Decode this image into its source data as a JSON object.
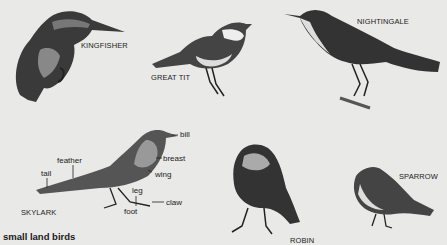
{
  "caption": "small land birds",
  "birds": [
    {
      "name": "KINGFISHER"
    },
    {
      "name": "GREAT TIT"
    },
    {
      "name": "NIGHTINGALE"
    },
    {
      "name": "SKYLARK"
    },
    {
      "name": "ROBIN"
    },
    {
      "name": "SPARROW"
    }
  ],
  "skylark_parts": {
    "bill": "bill",
    "breast": "breast",
    "wing": "wing",
    "feather": "feather",
    "tail": "tail",
    "leg": "leg",
    "claw": "claw",
    "foot": "foot"
  },
  "colors": {
    "background": "#e9e9e7",
    "ink": "#1a1a1a"
  }
}
